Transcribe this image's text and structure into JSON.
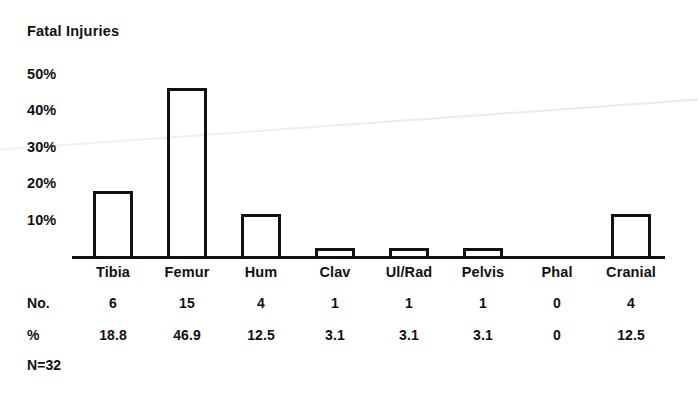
{
  "chart_data": {
    "type": "bar",
    "title": "Fatal Injuries",
    "xlabel": "",
    "ylabel": "",
    "ylim": [
      0,
      55
    ],
    "grid": false,
    "legend": "none",
    "categories": [
      "Tibia",
      "Femur",
      "Hum",
      "Clav",
      "Ul/Rad",
      "Pelvis",
      "Phal",
      "Cranial"
    ],
    "values": [
      18.8,
      46.9,
      12.5,
      3.1,
      3.1,
      3.1,
      0,
      12.5
    ],
    "counts": [
      6,
      15,
      4,
      1,
      1,
      1,
      0,
      4
    ],
    "ytick_labels": [
      "50%",
      "40%",
      "30%",
      "20%",
      "10%"
    ],
    "ytick_values": [
      50,
      40,
      30,
      20,
      10
    ],
    "bar_style": "outline",
    "annotation": "N=32",
    "total_n": 32
  },
  "table": {
    "row_labels": [
      "No.",
      "%"
    ],
    "counts_display": [
      "6",
      "15",
      "4",
      "1",
      "1",
      "1",
      "0",
      "4"
    ],
    "percents_display": [
      "18.8",
      "46.9",
      "12.5",
      "3.1",
      "3.1",
      "3.1",
      "0",
      "12.5"
    ]
  },
  "colors": {
    "ink": "#111111",
    "background": "#ffffff"
  }
}
